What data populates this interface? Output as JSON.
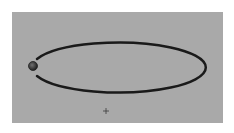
{
  "scene": {
    "background_color": "#ffffff",
    "panel_color": "#a9a9a9",
    "track": {
      "shape": "ellipse",
      "stroke_color": "#1a1a1a",
      "stroke_width": 2.5,
      "cx": 120,
      "cy": 67,
      "rx": 87,
      "ry": 25,
      "gap": "left side, around the ball"
    },
    "ball": {
      "cx": 33,
      "cy": 66,
      "r": 4.5,
      "color": "#2a2a2a",
      "highlight": "#6a6a6a"
    },
    "crosshair": {
      "x": 106,
      "y": 111,
      "size": 5,
      "color": "#3a3a3a"
    }
  }
}
